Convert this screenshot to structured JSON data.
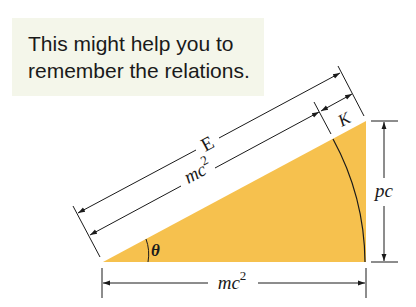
{
  "callout": {
    "line1": "This might help you to",
    "line2": "remember the relations."
  },
  "diagram": {
    "fill_color": "#F6C14E",
    "line_color": "#1a1a1a",
    "labels": {
      "hypotenuse_total": "E",
      "hypotenuse_rest": "mc",
      "hypotenuse_rest_exp": "2",
      "kinetic": "K",
      "vertical": "pc",
      "base": "mc",
      "base_exp": "2",
      "angle": "θ"
    }
  }
}
